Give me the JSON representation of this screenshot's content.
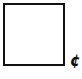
{
  "box": {
    "border_color": "#111111",
    "fill": "#ffffff"
  },
  "symbol": {
    "text": "¢",
    "name": "cent-sign"
  }
}
